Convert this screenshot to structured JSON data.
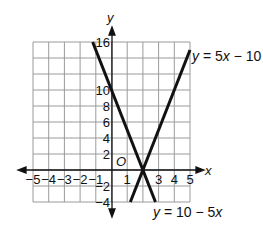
{
  "chart_data": {
    "type": "line",
    "title": "",
    "xlabel": "x",
    "ylabel": "y",
    "origin_label": "O",
    "xlim": [
      -5,
      5
    ],
    "ylim": [
      -4,
      16
    ],
    "grid": true,
    "x_ticks": [
      "-5",
      "-4",
      "-3",
      "-2",
      "-1",
      "1",
      "3",
      "4",
      "5"
    ],
    "y_ticks": [
      "16",
      "10",
      "8",
      "6",
      "4",
      "2",
      "-2",
      "-4"
    ],
    "series": [
      {
        "name": "y = 5x - 10",
        "label_parts": [
          "y",
          " = 5",
          "x",
          " − 10"
        ],
        "points": [
          [
            1.2,
            -4
          ],
          [
            5,
            15
          ]
        ]
      },
      {
        "name": "y = 10 - 5x",
        "label_parts": [
          "y",
          " = 10 − 5",
          "x"
        ],
        "points": [
          [
            -1.2,
            16
          ],
          [
            2.8,
            -4
          ]
        ]
      }
    ],
    "intersection": [
      2,
      0
    ]
  }
}
